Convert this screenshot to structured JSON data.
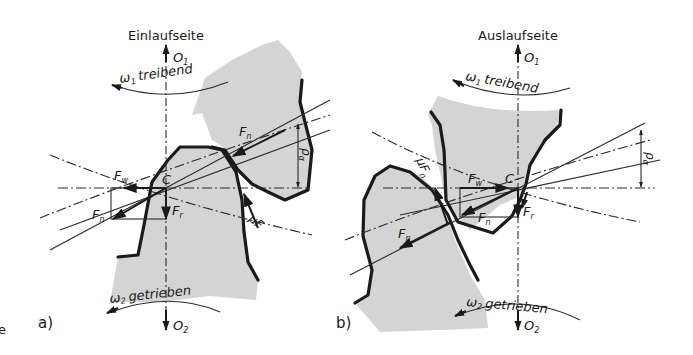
{
  "figure": {
    "panels": [
      {
        "id": "a",
        "panel_label": "a)",
        "side_title": "Einlaufseite",
        "top_axis": "O",
        "top_axis_sub": "1",
        "top_rotation_symbol": "ω",
        "top_rotation_sub": "1",
        "top_rotation_text": "treibend",
        "bottom_axis": "O",
        "bottom_axis_sub": "2",
        "bottom_rotation_symbol": "ω",
        "bottom_rotation_sub": "2",
        "bottom_rotation_text": "getrieben",
        "pitch_point": "C",
        "forces": {
          "normal_upper": "F",
          "normal_upper_sub": "n",
          "normal_lower": "F",
          "normal_lower_sub": "n",
          "tangential": "F",
          "tangential_sub": "w",
          "radial": "F",
          "radial_sub": "r",
          "friction": "μF"
        },
        "dimension": "ρ",
        "dimension_sub": "α"
      },
      {
        "id": "b",
        "panel_label": "b)",
        "side_title": "Auslaufseite",
        "top_axis": "O",
        "top_axis_sub": "1",
        "top_rotation_symbol": "ω",
        "top_rotation_sub": "1",
        "top_rotation_text": "treibend",
        "bottom_axis": "O",
        "bottom_axis_sub": "2",
        "bottom_rotation_symbol": "ω",
        "bottom_rotation_sub": "2",
        "bottom_rotation_text": "getrieben",
        "pitch_point": "C",
        "forces": {
          "normal_upper": "F",
          "normal_upper_sub": "n",
          "normal_lower": "F",
          "normal_lower_sub": "n",
          "tangential": "F",
          "tangential_sub": "w",
          "radial": "F",
          "radial_sub": "r",
          "friction": "μF",
          "friction_sub": "n"
        },
        "dimension": "ρ",
        "dimension_sub": "α"
      }
    ],
    "edge_fragment": "e"
  }
}
